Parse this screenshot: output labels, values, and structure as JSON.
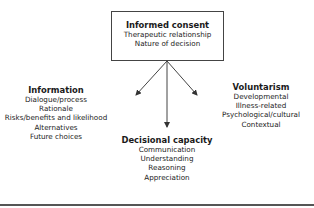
{
  "diagram": {
    "center": {
      "title": "Informed consent",
      "items": [
        "Therapeutic relationship",
        "Nature of decision"
      ]
    },
    "left": {
      "title": "Information",
      "items": [
        "Dialogue/process",
        "Rationale",
        "Risks/benefits and likelihood",
        "Alternatives",
        "Future choices"
      ]
    },
    "right": {
      "title": "Voluntarism",
      "items": [
        "Developmental",
        "Illness-related",
        "Psychological/cultural",
        "Contextual"
      ]
    },
    "bottom": {
      "title": "Decisional capacity",
      "items": [
        "Communication",
        "Understanding",
        "Reasoning",
        "Appreciation"
      ]
    },
    "colors": {
      "line": "#444444",
      "text": "#1a1a1a",
      "rule": "#555555"
    }
  }
}
